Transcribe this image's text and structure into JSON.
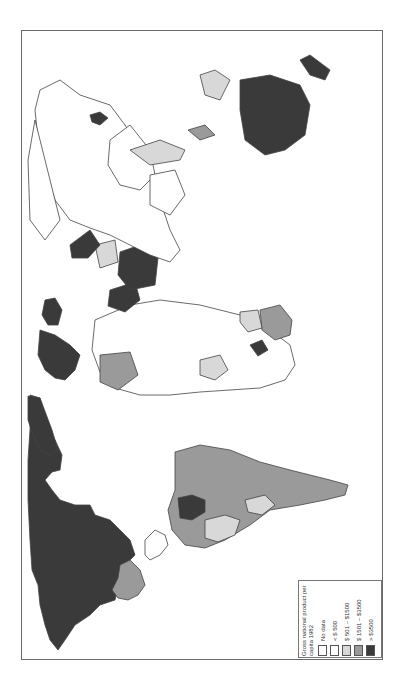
{
  "map": {
    "title": "World map: Gross national product per capita, 1982",
    "orientation": "rotated 90 degrees counter-clockwise",
    "colors": {
      "no_data": "#ffffff",
      "lt_500": "#ffffff",
      "501_1500": "#d8d8d8",
      "1501_3500": "#9a9a9a",
      "gt_3500": "#3a3a3a",
      "border": "#444444"
    }
  },
  "legend": {
    "title": "Gross national product per capita 1982",
    "items": [
      {
        "label": "No data",
        "color": "#ffffff"
      },
      {
        "label": "< $ 500",
        "color": "#ffffff"
      },
      {
        "label": "$ 501 – $1500",
        "color": "#d8d8d8"
      },
      {
        "label": "$ 1501 – $3500",
        "color": "#9a9a9a"
      },
      {
        "label": "> $3500",
        "color": "#3a3a3a"
      }
    ]
  }
}
